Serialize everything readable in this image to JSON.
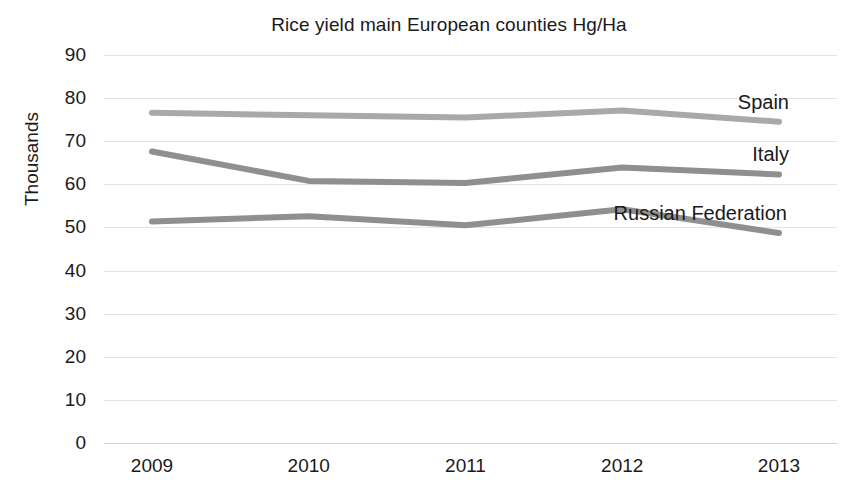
{
  "chart_data": {
    "type": "line",
    "title": "Rice yield main European counties Hg/Ha",
    "xlabel": "",
    "ylabel": "Thousands",
    "x": [
      "2009",
      "2010",
      "2011",
      "2012",
      "2013"
    ],
    "categories": [
      "2009",
      "2010",
      "2011",
      "2012",
      "2013"
    ],
    "ylim": [
      0,
      90
    ],
    "ytick_step": 10,
    "yticks": [
      "90",
      "80",
      "70",
      "60",
      "50",
      "40",
      "30",
      "20",
      "10",
      "0"
    ],
    "grid": true,
    "legend_position": "inline-right-of-series",
    "series": [
      {
        "name": "Spain",
        "color": "#a9a9a9",
        "values": [
          76.6,
          76.0,
          75.5,
          77.1,
          74.5
        ],
        "label": "Spain"
      },
      {
        "name": "Italy",
        "color": "#8f8f8f",
        "values": [
          67.6,
          60.8,
          60.3,
          63.9,
          62.3
        ],
        "label": "Italy"
      },
      {
        "name": "Russian Federation",
        "color": "#8f8f8f",
        "values": [
          51.4,
          52.6,
          50.5,
          54.2,
          48.7
        ],
        "label": "Russian Federation"
      }
    ],
    "annotations": [
      {
        "text": "Spain",
        "series": "Spain"
      },
      {
        "text": "Italy",
        "series": "Italy"
      },
      {
        "text": "Russian Federation",
        "series": "Russian Federation"
      }
    ]
  }
}
